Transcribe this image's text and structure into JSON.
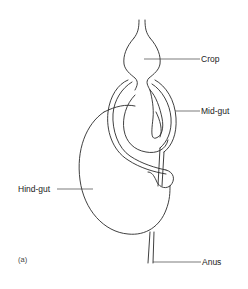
{
  "figure": {
    "panel_label": "(a)",
    "labels": {
      "crop": "Crop",
      "mid_gut": "Mid-gut",
      "hind_gut": "Hind-gut",
      "anus": "Anus"
    },
    "line_color": "#2a2a2a",
    "background": "#ffffff"
  }
}
